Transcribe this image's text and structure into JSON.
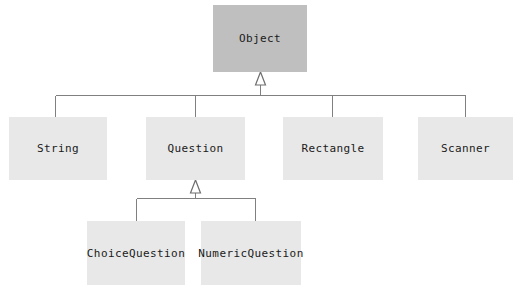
{
  "diagram": {
    "type": "class-hierarchy",
    "colors": {
      "root_box_fill": "#bfbfbf",
      "sub_box_fill": "#e8e8e8",
      "line_stroke": "#808080",
      "text_color": "#1a1a1a",
      "background": "#ffffff"
    },
    "nodes": [
      {
        "id": "object",
        "label": "Object",
        "level": 0,
        "fill": "#bfbfbf",
        "x": 213,
        "y": 5,
        "w": 94,
        "h": 67
      },
      {
        "id": "string",
        "label": "String",
        "level": 1,
        "fill": "#e8e8e8",
        "x": 9,
        "y": 117,
        "w": 98,
        "h": 63
      },
      {
        "id": "question",
        "label": "Question",
        "level": 1,
        "fill": "#e8e8e8",
        "x": 146,
        "y": 117,
        "w": 99,
        "h": 63
      },
      {
        "id": "rectangle",
        "label": "Rectangle",
        "level": 1,
        "fill": "#e8e8e8",
        "x": 283,
        "y": 117,
        "w": 100,
        "h": 63
      },
      {
        "id": "scanner",
        "label": "Scanner",
        "level": 1,
        "fill": "#e8e8e8",
        "x": 418,
        "y": 117,
        "w": 95,
        "h": 63
      },
      {
        "id": "choice-question",
        "label": "ChoiceQuestion",
        "level": 2,
        "fill": "#e8e8e8",
        "x": 87,
        "y": 221,
        "w": 98,
        "h": 64
      },
      {
        "id": "numeric-question",
        "label": "NumericQuestion",
        "level": 2,
        "fill": "#e8e8e8",
        "x": 201,
        "y": 221,
        "w": 100,
        "h": 64
      }
    ],
    "edges": [
      {
        "from": "string",
        "to": "object",
        "kind": "inheritance"
      },
      {
        "from": "question",
        "to": "object",
        "kind": "inheritance"
      },
      {
        "from": "rectangle",
        "to": "object",
        "kind": "inheritance"
      },
      {
        "from": "scanner",
        "to": "object",
        "kind": "inheritance"
      },
      {
        "from": "choice-question",
        "to": "question",
        "kind": "inheritance"
      },
      {
        "from": "numeric-question",
        "to": "question",
        "kind": "inheritance"
      }
    ]
  }
}
